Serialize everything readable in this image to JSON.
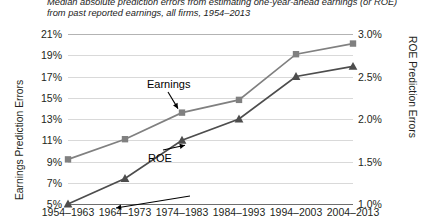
{
  "caption": {
    "line1": "Median absolute prediction errors from estimating one-year-ahead earnings (or ROE)",
    "line2": "from past reported earnings, all firms, 1954–2013"
  },
  "axes": {
    "left_title": "Earnings Prediction Errors",
    "right_title": "ROE Prediction Errors",
    "left_ticks": [
      "21%",
      "19%",
      "17%",
      "15%",
      "13%",
      "11%",
      "9%",
      "7%",
      "5%"
    ],
    "right_ticks": [
      "3.0%",
      "2.5%",
      "2.0%",
      "1.5%",
      "1.0%"
    ]
  },
  "annotations": {
    "earnings": "Earnings",
    "roe": "ROE"
  },
  "chart_data": {
    "type": "line",
    "title": "Median absolute prediction errors from estimating one-year-ahead earnings (or ROE) from past reported earnings, all firms, 1954–2013",
    "xlabel": "",
    "categories": [
      "1954–1963",
      "1964–1973",
      "1974–1983",
      "1984–1993",
      "1994–2003",
      "2004–2013"
    ],
    "series": [
      {
        "name": "Earnings",
        "axis": "left",
        "ylabel": "Earnings Prediction Errors",
        "ylim": [
          5,
          21
        ],
        "values": [
          9.2,
          11.1,
          13.6,
          14.8,
          19.1,
          20.1
        ],
        "color": "#808080",
        "marker": "square"
      },
      {
        "name": "ROE",
        "axis": "right",
        "ylabel": "ROE Prediction Errors",
        "ylim": [
          1.0,
          3.0
        ],
        "values": [
          1.0,
          1.3,
          1.75,
          2.0,
          2.5,
          2.62
        ],
        "color": "#4d4d4d",
        "marker": "triangle"
      }
    ],
    "grid": true,
    "legend": "inline-annotations"
  }
}
